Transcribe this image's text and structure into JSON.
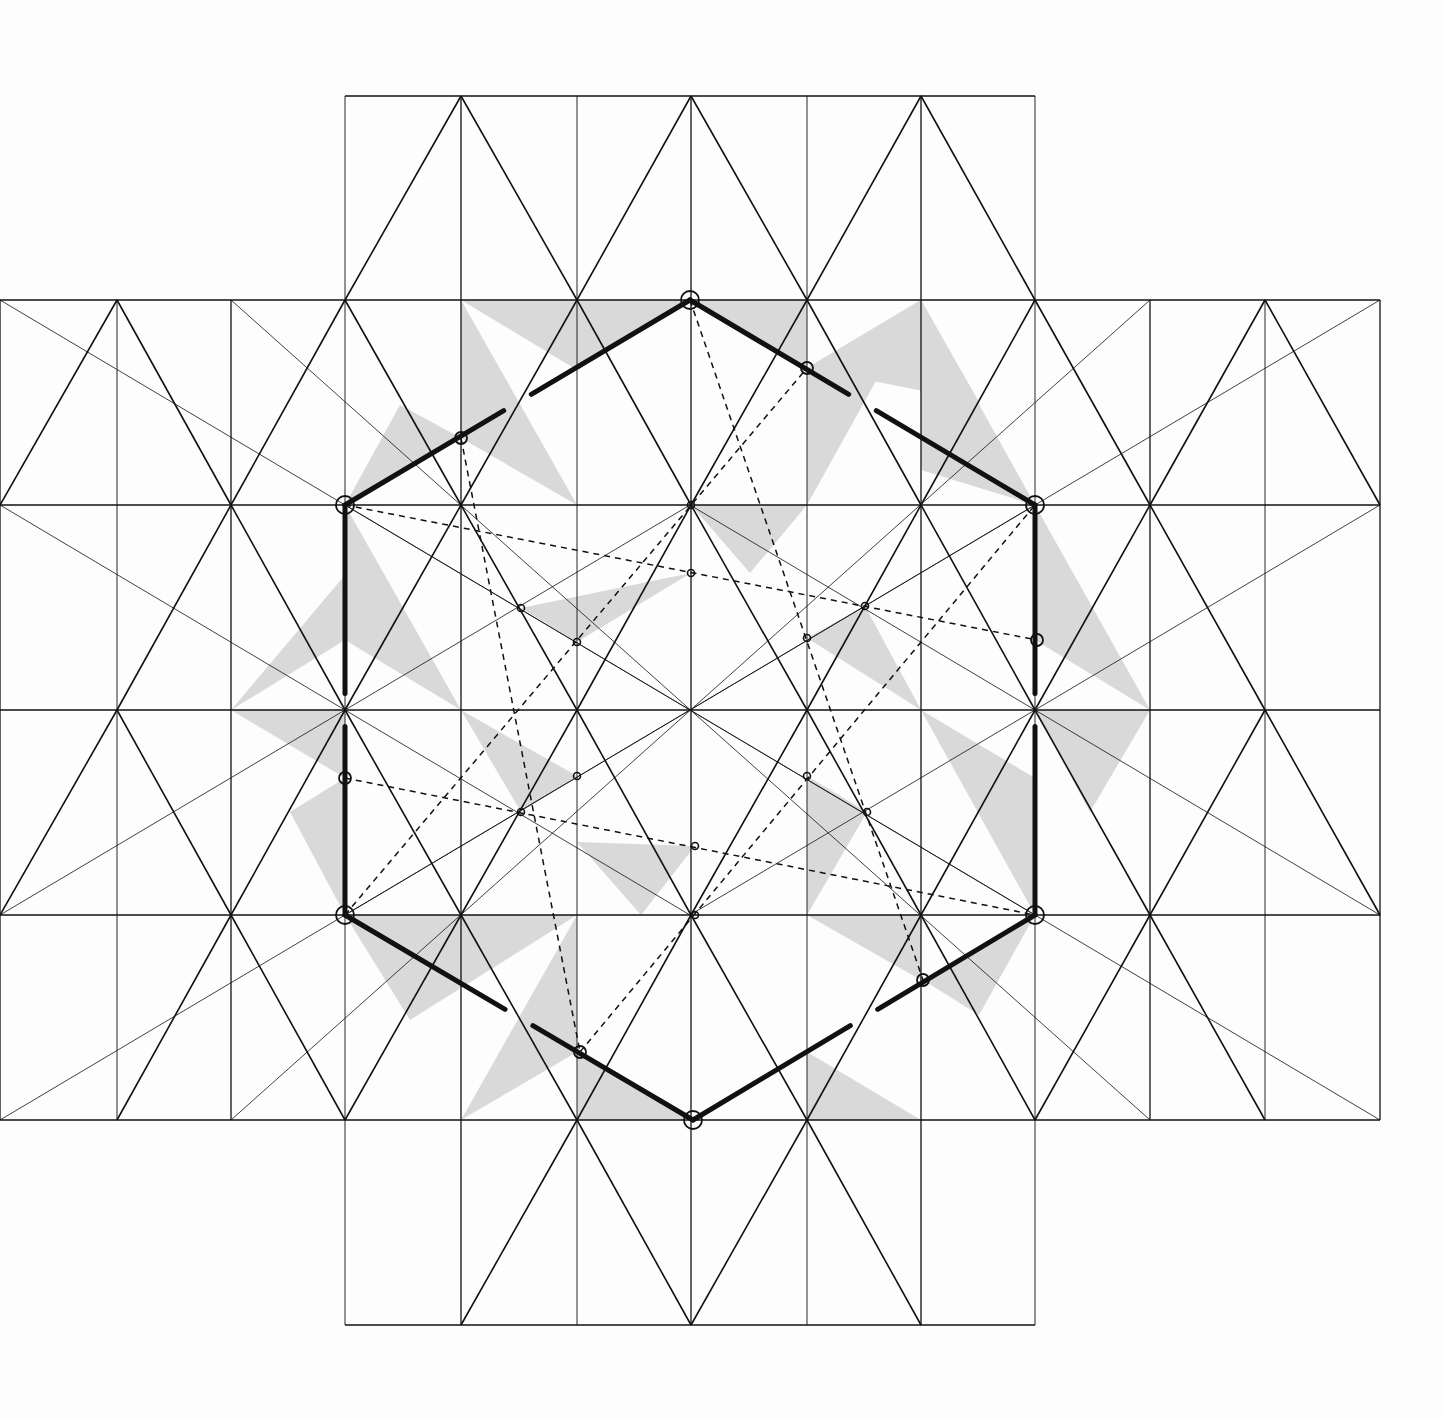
{
  "diagram": {
    "colors": {
      "line": "#111111",
      "shade": "#d9d9d9",
      "background": "#fdfdfd"
    },
    "xs": [
      0,
      117,
      231,
      345,
      461,
      577,
      691,
      807,
      921,
      1035,
      1150,
      1265,
      1380
    ],
    "ys": [
      96,
      300,
      505,
      710,
      915,
      1120,
      1325
    ],
    "hexagon": [
      [
        690,
        300
      ],
      [
        1035,
        505
      ],
      [
        1035,
        915
      ],
      [
        693,
        1120
      ],
      [
        345,
        915
      ],
      [
        345,
        505
      ]
    ],
    "hexagon_midpoints": [
      [
        461,
        438
      ],
      [
        807,
        368
      ],
      [
        1037,
        640
      ],
      [
        923,
        980
      ],
      [
        580,
        1052
      ],
      [
        345,
        778
      ]
    ],
    "inner_points": [
      [
        691,
        505
      ],
      [
        691,
        573
      ],
      [
        865,
        606
      ],
      [
        807,
        638
      ],
      [
        521,
        608
      ],
      [
        577,
        642
      ],
      [
        577,
        776
      ],
      [
        807,
        776
      ],
      [
        521,
        812
      ],
      [
        867,
        812
      ],
      [
        695,
        846
      ],
      [
        695,
        915
      ]
    ],
    "shaded_triangles": [
      [
        [
          461,
          300
        ],
        [
          577,
          505
        ],
        [
          461,
          438
        ]
      ],
      [
        [
          461,
          300
        ],
        [
          690,
          300
        ],
        [
          577,
          370
        ]
      ],
      [
        [
          690,
          300
        ],
        [
          807,
          300
        ],
        [
          807,
          368
        ]
      ],
      [
        [
          807,
          368
        ],
        [
          921,
          300
        ],
        [
          979,
          402
        ]
      ],
      [
        [
          921,
          300
        ],
        [
          1035,
          505
        ],
        [
          921,
          470
        ]
      ],
      [
        [
          807,
          505
        ],
        [
          921,
          300
        ],
        [
          807,
          368
        ]
      ],
      [
        [
          345,
          505
        ],
        [
          461,
          438
        ],
        [
          400,
          405
        ]
      ],
      [
        [
          345,
          505
        ],
        [
          461,
          710
        ],
        [
          345,
          640
        ]
      ],
      [
        [
          231,
          710
        ],
        [
          345,
          575
        ],
        [
          345,
          640
        ]
      ],
      [
        [
          231,
          710
        ],
        [
          345,
          778
        ],
        [
          345,
          710
        ]
      ],
      [
        [
          290,
          812
        ],
        [
          345,
          778
        ],
        [
          345,
          915
        ]
      ],
      [
        [
          1035,
          505
        ],
        [
          1150,
          710
        ],
        [
          1035,
          640
        ]
      ],
      [
        [
          1035,
          710
        ],
        [
          1150,
          710
        ],
        [
          1090,
          812
        ]
      ],
      [
        [
          1035,
          778
        ],
        [
          921,
          710
        ],
        [
          1035,
          915
        ]
      ],
      [
        [
          345,
          915
        ],
        [
          577,
          915
        ],
        [
          410,
          1020
        ]
      ],
      [
        [
          461,
          1120
        ],
        [
          577,
          1052
        ],
        [
          577,
          915
        ]
      ],
      [
        [
          577,
          1120
        ],
        [
          693,
          1120
        ],
        [
          577,
          1052
        ]
      ],
      [
        [
          807,
          1120
        ],
        [
          921,
          1120
        ],
        [
          807,
          1052
        ]
      ],
      [
        [
          807,
          915
        ],
        [
          921,
          915
        ],
        [
          921,
          980
        ]
      ],
      [
        [
          923,
          980
        ],
        [
          979,
          1015
        ],
        [
          1035,
          915
        ]
      ],
      [
        [
          521,
          608
        ],
        [
          691,
          573
        ],
        [
          577,
          642
        ]
      ],
      [
        [
          691,
          505
        ],
        [
          807,
          505
        ],
        [
          750,
          573
        ]
      ],
      [
        [
          807,
          638
        ],
        [
          865,
          606
        ],
        [
          921,
          710
        ]
      ],
      [
        [
          461,
          710
        ],
        [
          577,
          776
        ],
        [
          521,
          812
        ]
      ],
      [
        [
          807,
          776
        ],
        [
          867,
          812
        ],
        [
          807,
          915
        ]
      ],
      [
        [
          577,
          842
        ],
        [
          695,
          846
        ],
        [
          641,
          915
        ]
      ]
    ]
  }
}
